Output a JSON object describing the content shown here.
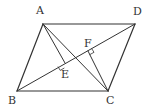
{
  "diagram": {
    "type": "geometry-parallelogram",
    "stroke_color": "#333333",
    "background": "#ffffff",
    "points": {
      "A": {
        "label": "A",
        "x": 43,
        "y": 24
      },
      "B": {
        "label": "B",
        "x": 17,
        "y": 91
      },
      "C": {
        "label": "C",
        "x": 108,
        "y": 91
      },
      "D": {
        "label": "D",
        "x": 135,
        "y": 24
      },
      "E": {
        "label": "E",
        "x": 65,
        "y": 63
      },
      "F": {
        "label": "F",
        "x": 88,
        "y": 51
      }
    },
    "segments": [
      "AB",
      "BC",
      "CD",
      "DA",
      "AC",
      "BD",
      "AE",
      "CF"
    ],
    "right_angles": [
      "AEB (AE ⊥ BD)",
      "CFD (CF ⊥ BD)"
    ]
  }
}
